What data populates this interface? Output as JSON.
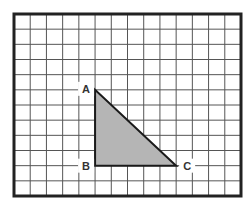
{
  "diagram": {
    "type": "grid-triangle",
    "grid": {
      "columns": 14,
      "rows": 12,
      "left": 14,
      "top": 14,
      "right": 241,
      "bottom": 196,
      "line_color": "#555555",
      "border_color": "#222222"
    },
    "triangle": {
      "fill": "#b5b5b5",
      "stroke": "#1a1a1a",
      "vertices": [
        {
          "label": "A",
          "col": 5,
          "row": 5
        },
        {
          "label": "B",
          "col": 5,
          "row": 10
        },
        {
          "label": "C",
          "col": 10,
          "row": 10
        }
      ]
    },
    "labels": {
      "a": "A",
      "b": "B",
      "c": "C"
    }
  }
}
